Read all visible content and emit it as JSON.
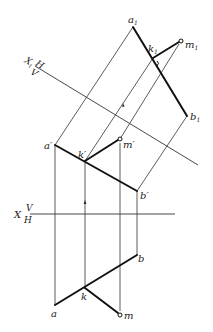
{
  "diagram": {
    "title": "",
    "axes": {
      "x_main": {
        "label_X": "X",
        "label_top": "V",
        "label_bottom": "H",
        "y": 214,
        "x1": 30,
        "x2": 175
      },
      "x1_aux": {
        "label_X": "X",
        "label_sub": "1",
        "label_top": "H",
        "label_bottom": "V",
        "from": [
          35,
          66
        ],
        "to": [
          198,
          165
        ]
      }
    },
    "points": {
      "a1": {
        "label": "a",
        "sub": "1",
        "x": 133,
        "y": 27
      },
      "b1": {
        "label": "b",
        "sub": "1",
        "x": 187,
        "y": 116
      },
      "k1": {
        "label": "k",
        "sub": "1",
        "x": 153,
        "y": 58
      },
      "m1": {
        "label": "m",
        "sub": "1",
        "x": 181,
        "y": 41
      },
      "a_prime": {
        "label": "a′",
        "x": 55,
        "y": 145
      },
      "b_prime": {
        "label": "b′",
        "x": 137,
        "y": 191
      },
      "k_prime": {
        "label": "k′",
        "x": 85,
        "y": 161
      },
      "m_prime": {
        "label": "m′",
        "x": 120,
        "y": 139
      },
      "a": {
        "label": "a",
        "x": 55,
        "y": 305
      },
      "b": {
        "label": "b",
        "x": 137,
        "y": 255
      },
      "k": {
        "label": "k",
        "x": 85,
        "y": 288
      },
      "m": {
        "label": "m",
        "x": 120,
        "y": 315
      }
    },
    "colors": {
      "stroke": "#222222",
      "background": "#ffffff"
    }
  }
}
